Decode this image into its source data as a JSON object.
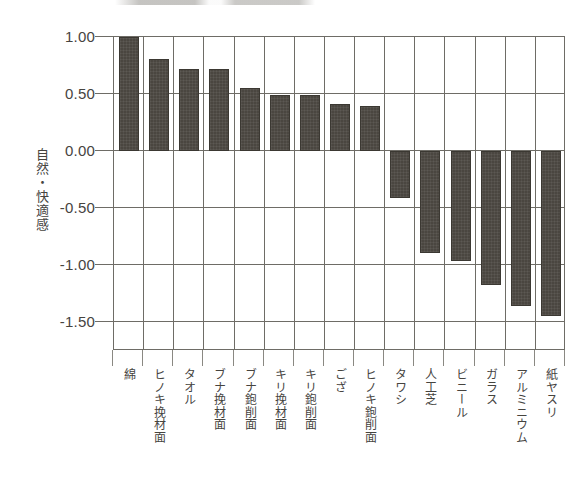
{
  "chart_data": {
    "type": "bar",
    "title": "",
    "subtitle": "",
    "xlabel": "",
    "ylabel": "自然・快適感",
    "ylim": [
      -1.75,
      1.0
    ],
    "ytick_labels": [
      "1.00",
      "0.50",
      "0.00",
      "-0.50",
      "-1.00",
      "-1.50"
    ],
    "ytick_values": [
      1.0,
      0.5,
      0.0,
      -0.5,
      -1.0,
      -1.5
    ],
    "grid": true,
    "legend": null,
    "bar_color": "#4a4640",
    "categories": [
      "綿",
      "ヒノキ挽材面",
      "タオル",
      "ブナ挽材面",
      "ブナ鉋削面",
      "キリ挽材面",
      "キリ鉋削面",
      "ござ",
      "ヒノキ鉋削面",
      "タワシ",
      "人工芝",
      "ビニール",
      "ガラス",
      "アルミニウム",
      "紙ヤスリ"
    ],
    "values": [
      1.0,
      0.81,
      0.72,
      0.72,
      0.55,
      0.49,
      0.49,
      0.41,
      0.4,
      -0.41,
      -0.89,
      -0.96,
      -1.17,
      -1.36,
      -1.44
    ]
  }
}
